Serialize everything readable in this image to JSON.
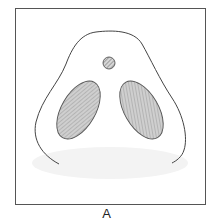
{
  "figure": {
    "label": "A",
    "colors": {
      "frame": "#555555",
      "outline": "#444444",
      "fill": "#c8c8c8",
      "hatch": "#8a8a8a",
      "shadow": "#f1f1f1"
    },
    "shapes": [
      {
        "name": "outer-contour",
        "type": "open-curve"
      },
      {
        "name": "small-hatched-circle",
        "type": "circle"
      },
      {
        "name": "left-hatched-ellipse",
        "type": "ellipse"
      },
      {
        "name": "right-hatched-ellipse",
        "type": "ellipse"
      }
    ]
  }
}
